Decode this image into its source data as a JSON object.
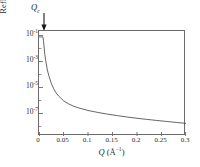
{
  "chart_data": {
    "type": "line",
    "title": "",
    "xlabel": "Q (Å⁻¹)",
    "ylabel": "Reflectivity",
    "xlim": [
      0,
      0.3
    ],
    "ylim": [
      1e-08,
      3
    ],
    "yscale": "log",
    "xscale": "linear",
    "grid": false,
    "legend": false,
    "xticks": [
      0,
      0.05,
      0.1,
      0.15,
      0.2,
      0.25,
      0.3
    ],
    "xtick_labels": [
      "0",
      "0.05",
      "0.1",
      "0.15",
      "0.2",
      "0.25",
      "0.3"
    ],
    "yticks": [
      0.1,
      0.001,
      1e-05,
      1e-07
    ],
    "ytick_labels": [
      "10⁻¹",
      "10⁻³",
      "10⁻⁵",
      "10⁻⁷"
    ],
    "ytick_exponents": [
      "-1",
      "-3",
      "-5",
      "-7"
    ],
    "series": [
      {
        "name": "Fresnel reflectivity",
        "x": [
          0.0,
          0.004,
          0.008,
          0.009,
          0.01,
          0.012,
          0.014,
          0.017,
          0.02,
          0.025,
          0.03,
          0.035,
          0.04,
          0.05,
          0.06,
          0.07,
          0.08,
          0.1,
          0.12,
          0.14,
          0.16,
          0.18,
          0.2,
          0.22,
          0.24,
          0.26,
          0.28,
          0.3
        ],
        "y": [
          1.0,
          1.0,
          1.0,
          0.55,
          0.22,
          0.035,
          0.01,
          0.0022,
          0.00075,
          0.00018,
          6.5e-05,
          3e-05,
          1.7e-05,
          7e-06,
          4e-06,
          2.6e-06,
          1.9e-06,
          1.15e-06,
          8e-07,
          5.8e-07,
          4.4e-07,
          3.4e-07,
          2.7e-07,
          2.2e-07,
          1.8e-07,
          1.5e-07,
          1.25e-07,
          1.05e-07
        ]
      }
    ],
    "annotations": [
      {
        "label_symbol": "Q",
        "label_subscript": "c",
        "label_text": "Qc",
        "marker": "down-arrow",
        "x": 0.008
      }
    ],
    "colors": {
      "curve": "#555555",
      "frame": "#6b6b6b",
      "text": "#2b2b2b",
      "arrow": "#1a1a1a",
      "background": "#ffffff"
    }
  }
}
